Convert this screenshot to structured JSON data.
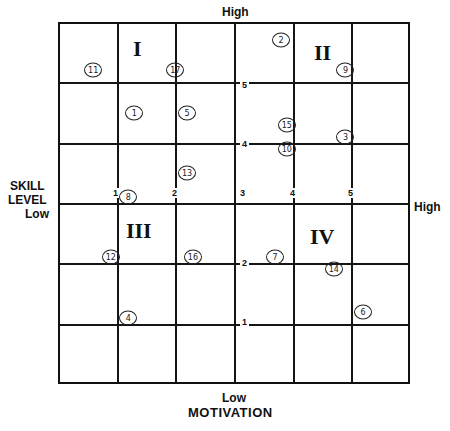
{
  "axes": {
    "y_title": [
      "SKILL",
      "LEVEL"
    ],
    "y_low": "Low",
    "y_high": "High",
    "x_title": "MOTIVATION",
    "x_low": "Low",
    "x_high": "High"
  },
  "quadrants": [
    "I",
    "II",
    "III",
    "IV"
  ],
  "ticks": {
    "x": [
      "1",
      "2",
      "3",
      "4",
      "5"
    ],
    "y": [
      "1",
      "2",
      "3",
      "4",
      "5"
    ]
  },
  "chart_data": {
    "type": "scatter",
    "title": "",
    "xlabel": "MOTIVATION (Low → High)",
    "ylabel": "SKILL LEVEL (Low → High)",
    "xlim": [
      0,
      6
    ],
    "ylim": [
      0,
      6
    ],
    "grid": true,
    "quadrant_labels": {
      "I": "top-left",
      "II": "top-right",
      "III": "bottom-left",
      "IV": "bottom-right"
    },
    "points": [
      {
        "label": "1",
        "x": 1.3,
        "y": 4.5
      },
      {
        "label": "2",
        "x": 3.8,
        "y": 5.7
      },
      {
        "label": "3",
        "x": 4.9,
        "y": 4.1
      },
      {
        "label": "4",
        "x": 1.2,
        "y": 1.1
      },
      {
        "label": "5",
        "x": 2.2,
        "y": 4.5
      },
      {
        "label": "6",
        "x": 5.2,
        "y": 1.2
      },
      {
        "label": "7",
        "x": 3.7,
        "y": 2.1
      },
      {
        "label": "8",
        "x": 1.2,
        "y": 3.1
      },
      {
        "label": "9",
        "x": 4.9,
        "y": 5.2
      },
      {
        "label": "10",
        "x": 3.9,
        "y": 3.9
      },
      {
        "label": "11",
        "x": 0.6,
        "y": 5.2
      },
      {
        "label": "12",
        "x": 0.9,
        "y": 2.1
      },
      {
        "label": "13",
        "x": 2.2,
        "y": 3.5
      },
      {
        "label": "14",
        "x": 4.7,
        "y": 1.9
      },
      {
        "label": "15",
        "x": 3.9,
        "y": 4.3
      },
      {
        "label": "16",
        "x": 2.3,
        "y": 2.1
      },
      {
        "label": "17",
        "x": 2.0,
        "y": 5.2
      }
    ]
  }
}
